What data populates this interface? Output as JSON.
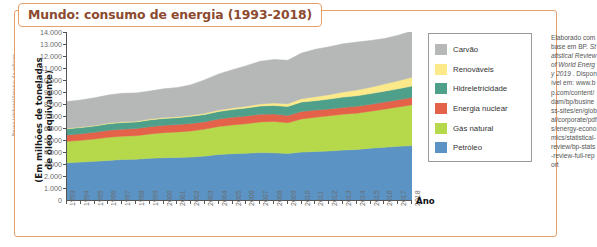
{
  "figure": {
    "credit": "Bruna Ishihara/Arquivo da editora",
    "title": "Mundo: consumo de energia (1993-2018)",
    "ano_label": "Ano",
    "frame_color": "#e8a06a",
    "title_color": "#8c4a2f"
  },
  "source": {
    "line1": "Elaborado",
    "line2": "com base em",
    "line3": "BP. ",
    "italic1": "Statistical",
    "italic2": "Review of",
    "italic3": "World Energy",
    "italic4": "2019",
    "line4": ". Disponível em:",
    "line5": "www.bp.com/content/dam/bp/business-sites/en/global/corporate/pdfs/energy-economics/statistical-review/bp-stats-review-full-report"
  },
  "legend": {
    "items": [
      {
        "label": "Carvão",
        "color": "#b5b8b6"
      },
      {
        "label": "Renováveis",
        "color": "#fbe98a"
      },
      {
        "label": "Hidreletricidade",
        "color": "#4fa08b"
      },
      {
        "label": "Energia nuclear",
        "color": "#e4614a"
      },
      {
        "label": "Gás natural",
        "color": "#b6d94c"
      },
      {
        "label": "Petróleo",
        "color": "#5b93c4"
      }
    ]
  },
  "chart_data": {
    "type": "area",
    "stacked": true,
    "title": "Mundo: consumo de energia (1993-2018)",
    "xlabel": "Ano",
    "ylabel": "(Em milhões de toneladas de óleo equivalente)",
    "ylim": [
      0,
      14000
    ],
    "ytick_step": 1000,
    "ytick_labels": [
      "0",
      "1.000",
      "2.000",
      "3.000",
      "4.000",
      "5.000",
      "6.000",
      "7.000",
      "8.000",
      "9.000",
      "10.000",
      "11.000",
      "12.000",
      "13.000",
      "14.000"
    ],
    "grid": false,
    "legend_position": "right",
    "categories": [
      1993,
      1994,
      1995,
      1996,
      1997,
      1998,
      1999,
      2000,
      2001,
      2002,
      2003,
      2004,
      2005,
      2006,
      2007,
      2008,
      2009,
      2010,
      2011,
      2012,
      2013,
      2014,
      2015,
      2016,
      2017,
      2018
    ],
    "xtick_labels": [
      "1993",
      "1994",
      "1995",
      "1996",
      "1997",
      "1998",
      "1999",
      "2000",
      "2001",
      "2002",
      "2003",
      "2004",
      "2005",
      "2006",
      "2007",
      "2008",
      "2009",
      "2010",
      "2011",
      "2012",
      "2013",
      "2014",
      "2015",
      "2016",
      "2017",
      "2018"
    ],
    "series": [
      {
        "name": "Petróleo",
        "color": "#5b93c4",
        "values": [
          3100,
          3160,
          3220,
          3300,
          3380,
          3400,
          3480,
          3520,
          3550,
          3580,
          3660,
          3800,
          3860,
          3900,
          3950,
          3930,
          3880,
          3990,
          4040,
          4090,
          4160,
          4210,
          4320,
          4400,
          4470,
          4540
        ]
      },
      {
        "name": "Gás natural",
        "color": "#b6d94c",
        "values": [
          1790,
          1810,
          1860,
          1930,
          1940,
          1960,
          2020,
          2090,
          2120,
          2180,
          2250,
          2330,
          2400,
          2460,
          2560,
          2610,
          2560,
          2770,
          2850,
          2930,
          2990,
          3020,
          3080,
          3170,
          3280,
          3390
        ]
      },
      {
        "name": "Energia nuclear",
        "color": "#e4614a",
        "values": [
          530,
          545,
          560,
          580,
          585,
          590,
          610,
          610,
          620,
          625,
          615,
          625,
          630,
          635,
          630,
          620,
          610,
          625,
          600,
          560,
          565,
          575,
          580,
          590,
          600,
          610
        ]
      },
      {
        "name": "Hidreletricidade",
        "color": "#4fa08b",
        "values": [
          510,
          520,
          530,
          545,
          550,
          555,
          565,
          580,
          570,
          595,
          605,
          630,
          650,
          670,
          690,
          720,
          740,
          780,
          790,
          830,
          860,
          880,
          885,
          910,
          920,
          950
        ]
      },
      {
        "name": "Renováveis",
        "color": "#fbe98a",
        "values": [
          40,
          45,
          48,
          52,
          56,
          60,
          65,
          72,
          80,
          90,
          100,
          115,
          130,
          150,
          175,
          205,
          235,
          275,
          320,
          370,
          420,
          475,
          530,
          590,
          660,
          745
        ]
      },
      {
        "name": "Carvão",
        "color": "#b5b8b6",
        "values": [
          2240,
          2250,
          2300,
          2340,
          2380,
          2360,
          2340,
          2390,
          2430,
          2540,
          2800,
          3010,
          3190,
          3380,
          3560,
          3630,
          3620,
          3800,
          3960,
          3990,
          4020,
          4000,
          3900,
          3790,
          3800,
          3850
        ]
      }
    ]
  }
}
